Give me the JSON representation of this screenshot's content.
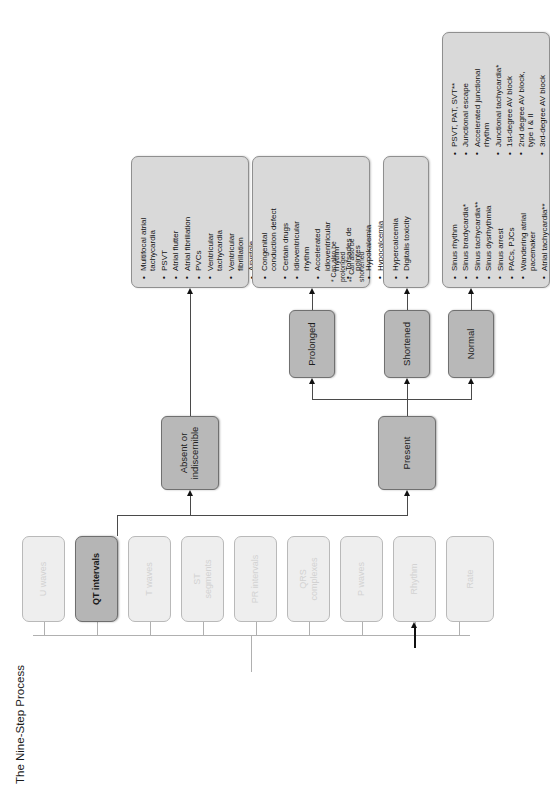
{
  "title": "The Nine-Step Process",
  "nine_steps": [
    {
      "label": "Rate",
      "active": false
    },
    {
      "label": "Rhythm",
      "active": false
    },
    {
      "label": "P waves",
      "active": false
    },
    {
      "label": "QRS\ncomplexes",
      "active": false
    },
    {
      "label": "PR intervals",
      "active": false
    },
    {
      "label": "ST\nsegments",
      "active": false
    },
    {
      "label": "T waves",
      "active": false
    },
    {
      "label": "QT intervals",
      "active": true
    },
    {
      "label": "U waves",
      "active": false
    }
  ],
  "branches": {
    "present": "Present",
    "absent": "Absent or\nindiscernible"
  },
  "sub_branches": {
    "normal": "Normal",
    "shortened": "Shortened",
    "prolonged": "Prolonged"
  },
  "lists": {
    "normal": [
      "Sinus rhythm",
      "Sinus bradycardia*",
      "Sinus tachycardia**",
      "Sinus dysrhythmia",
      "Sinus arrest",
      "PACs, PJCs",
      "Wandering atrial\npacemaker",
      "Atrial tachycardia**",
      "PSVT, PAT, SVT**",
      "Junctional escape",
      "Accelerated junctional\nrhythm",
      "Junctional tachycardia*",
      "1st-degree AV block",
      "2nd degree AV block,\ntype I & II",
      "3rd-degree AV block"
    ],
    "shortened": [
      "Hypercalcemia",
      "Digitalis toxicity"
    ],
    "prolonged": [
      "Congenital\nconduction defect",
      "Certain drugs",
      "Idioventricular\nrhythm",
      "Accelerated\nidioventricular\nrhythm",
      "Torsades de\npointes",
      "Hypokalemia",
      "Hypocalcemia"
    ],
    "absent": [
      "Multifocal atrial\ntachycardia",
      "PSVT",
      "Atrial flutter",
      "Atrial fibrillation",
      "PVCs",
      "Ventricular\ntachycardia",
      "Ventricular\nfibrillation",
      "Asystole"
    ]
  },
  "footnotes": [
    "*  Can also be\n    prolonged",
    "** Can also be\n    shortened"
  ],
  "colors": {
    "active_node": "#b5b5b5",
    "faded_node": "#eeeeee",
    "category_node": "#b8b8b8",
    "list_node": "#d9d9d9",
    "connector": "#4a4a4a",
    "background": "#ffffff"
  }
}
